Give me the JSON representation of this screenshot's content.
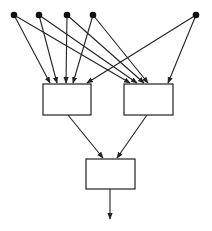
{
  "diagram": {
    "type": "layered-network",
    "colors": {
      "stroke": "#222222",
      "node_fill": "#111111",
      "box_fill": "#ffffff",
      "background": "#ffffff"
    },
    "input_nodes": [
      {
        "id": "n1",
        "x": 14,
        "y": 15
      },
      {
        "id": "n2",
        "x": 39,
        "y": 15
      },
      {
        "id": "n3",
        "x": 67,
        "y": 15
      },
      {
        "id": "n4",
        "x": 93,
        "y": 15
      },
      {
        "id": "n5",
        "x": 196,
        "y": 15
      }
    ],
    "boxes": [
      {
        "id": "left",
        "x": 43,
        "y": 84,
        "w": 48,
        "h": 31,
        "label": ""
      },
      {
        "id": "right",
        "x": 124,
        "y": 84,
        "w": 49,
        "h": 31,
        "label": ""
      },
      {
        "id": "bottom",
        "x": 86,
        "y": 159,
        "w": 49,
        "h": 30,
        "label": ""
      }
    ],
    "edges": [
      {
        "from": "n1",
        "to": "left",
        "x1": 14,
        "y1": 15,
        "x2": 50,
        "y2": 83
      },
      {
        "from": "n2",
        "to": "left",
        "x1": 39,
        "y1": 15,
        "x2": 57,
        "y2": 83
      },
      {
        "from": "n3",
        "to": "left",
        "x1": 67,
        "y1": 15,
        "x2": 66,
        "y2": 83
      },
      {
        "from": "n4",
        "to": "left",
        "x1": 93,
        "y1": 15,
        "x2": 73,
        "y2": 83
      },
      {
        "from": "n5",
        "to": "left",
        "x1": 196,
        "y1": 15,
        "x2": 87,
        "y2": 83
      },
      {
        "from": "n1",
        "to": "right",
        "x1": 14,
        "y1": 15,
        "x2": 130,
        "y2": 83
      },
      {
        "from": "n2",
        "to": "right",
        "x1": 39,
        "y1": 15,
        "x2": 137,
        "y2": 83
      },
      {
        "from": "n3",
        "to": "right",
        "x1": 67,
        "y1": 15,
        "x2": 144,
        "y2": 83
      },
      {
        "from": "n4",
        "to": "right",
        "x1": 93,
        "y1": 15,
        "x2": 148,
        "y2": 83
      },
      {
        "from": "n5",
        "to": "right",
        "x1": 196,
        "y1": 15,
        "x2": 168,
        "y2": 83
      },
      {
        "from": "left",
        "to": "bottom",
        "x1": 68,
        "y1": 115,
        "x2": 103,
        "y2": 158
      },
      {
        "from": "right",
        "to": "bottom",
        "x1": 147,
        "y1": 115,
        "x2": 117,
        "y2": 158
      },
      {
        "from": "bottom",
        "to": "output",
        "x1": 110,
        "y1": 189,
        "x2": 110,
        "y2": 219
      }
    ]
  }
}
